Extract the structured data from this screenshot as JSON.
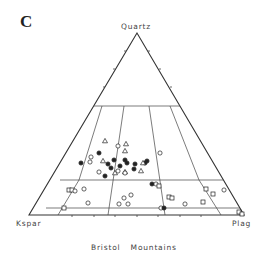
{
  "panel": {
    "letter": "C"
  },
  "diagram": {
    "type": "ternary-classification",
    "vertices": {
      "top": "Quartz",
      "bottom_left": "Kspar",
      "bottom_right": "Plag"
    },
    "caption": "Bristol Mountains",
    "colors": {
      "line": "#333333",
      "marker": "#222222",
      "background": "#ffffff"
    }
  },
  "legend_markers": {
    "filled_circle": "filled-circle",
    "open_circle": "open-circle",
    "open_triangle": "open-triangle",
    "open_square": "open-square"
  },
  "points": [
    {
      "shape": "open-triangle",
      "x": 105,
      "y": 141
    },
    {
      "shape": "open-circle",
      "x": 118,
      "y": 146
    },
    {
      "shape": "open-triangle",
      "x": 126,
      "y": 144
    },
    {
      "shape": "open-triangle",
      "x": 125,
      "y": 151
    },
    {
      "shape": "filled-circle",
      "x": 99,
      "y": 153
    },
    {
      "shape": "open-circle",
      "x": 91,
      "y": 157
    },
    {
      "shape": "open-circle",
      "x": 90,
      "y": 162
    },
    {
      "shape": "filled-circle",
      "x": 81,
      "y": 163
    },
    {
      "shape": "open-triangle",
      "x": 103,
      "y": 161
    },
    {
      "shape": "filled-circle",
      "x": 114,
      "y": 160
    },
    {
      "shape": "filled-circle",
      "x": 108,
      "y": 164
    },
    {
      "shape": "filled-circle",
      "x": 125,
      "y": 160
    },
    {
      "shape": "filled-circle",
      "x": 127,
      "y": 163
    },
    {
      "shape": "filled-circle",
      "x": 120,
      "y": 166
    },
    {
      "shape": "filled-circle",
      "x": 111,
      "y": 168
    },
    {
      "shape": "filled-circle",
      "x": 135,
      "y": 164
    },
    {
      "shape": "filled-circle",
      "x": 145,
      "y": 163
    },
    {
      "shape": "filled-circle",
      "x": 147,
      "y": 161
    },
    {
      "shape": "open-triangle",
      "x": 143,
      "y": 163
    },
    {
      "shape": "open-circle",
      "x": 118,
      "y": 171
    },
    {
      "shape": "open-triangle",
      "x": 115,
      "y": 173
    },
    {
      "shape": "open-triangle",
      "x": 125,
      "y": 172
    },
    {
      "shape": "filled-circle",
      "x": 134,
      "y": 169
    },
    {
      "shape": "open-circle",
      "x": 125,
      "y": 173
    },
    {
      "shape": "open-circle",
      "x": 99,
      "y": 172
    },
    {
      "shape": "open-triangle",
      "x": 141,
      "y": 171
    },
    {
      "shape": "filled-circle",
      "x": 105,
      "y": 176
    },
    {
      "shape": "open-circle",
      "x": 160,
      "y": 153
    },
    {
      "shape": "filled-circle",
      "x": 152,
      "y": 184
    },
    {
      "shape": "open-circle",
      "x": 156,
      "y": 184
    },
    {
      "shape": "open-square",
      "x": 159,
      "y": 186
    },
    {
      "shape": "open-square",
      "x": 69,
      "y": 190
    },
    {
      "shape": "open-square",
      "x": 72,
      "y": 190
    },
    {
      "shape": "open-circle",
      "x": 75,
      "y": 191
    },
    {
      "shape": "open-circle",
      "x": 84,
      "y": 189
    },
    {
      "shape": "open-circle",
      "x": 131,
      "y": 195
    },
    {
      "shape": "open-circle",
      "x": 124,
      "y": 198
    },
    {
      "shape": "open-square",
      "x": 169,
      "y": 197
    },
    {
      "shape": "open-square",
      "x": 172,
      "y": 198
    },
    {
      "shape": "open-square",
      "x": 206,
      "y": 189
    },
    {
      "shape": "open-square",
      "x": 213,
      "y": 194
    },
    {
      "shape": "open-circle",
      "x": 224,
      "y": 190
    },
    {
      "shape": "open-circle",
      "x": 88,
      "y": 203
    },
    {
      "shape": "open-square",
      "x": 64,
      "y": 208
    },
    {
      "shape": "open-circle",
      "x": 119,
      "y": 204
    },
    {
      "shape": "open-circle",
      "x": 128,
      "y": 204
    },
    {
      "shape": "open-circle",
      "x": 185,
      "y": 204
    },
    {
      "shape": "open-square",
      "x": 203,
      "y": 202
    },
    {
      "shape": "open-circle",
      "x": 161,
      "y": 208
    },
    {
      "shape": "filled-circle",
      "x": 164,
      "y": 208
    },
    {
      "shape": "open-square",
      "x": 239,
      "y": 212
    },
    {
      "shape": "open-square",
      "x": 242,
      "y": 214
    }
  ]
}
